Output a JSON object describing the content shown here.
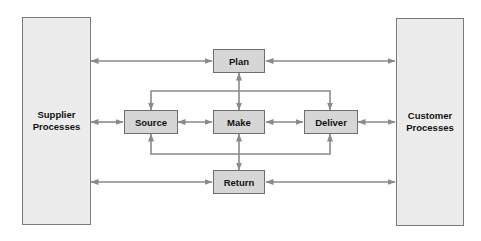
{
  "diagram": {
    "type": "process-flow",
    "external_entities": {
      "supplier": {
        "line1": "Supplier",
        "line2": "Processes"
      },
      "customer": {
        "line1": "Customer",
        "line2": "Processes"
      }
    },
    "processes": {
      "plan": "Plan",
      "source": "Source",
      "make": "Make",
      "deliver": "Deliver",
      "return": "Return"
    },
    "connections": [
      {
        "from": "Supplier Processes",
        "to": "Plan",
        "direction": "bidirectional"
      },
      {
        "from": "Plan",
        "to": "Customer Processes",
        "direction": "bidirectional"
      },
      {
        "from": "Plan",
        "to": "Make",
        "direction": "bidirectional"
      },
      {
        "from": "Plan",
        "to": "Source",
        "direction": "one-way"
      },
      {
        "from": "Plan",
        "to": "Deliver",
        "direction": "one-way"
      },
      {
        "from": "Supplier Processes",
        "to": "Source",
        "direction": "bidirectional"
      },
      {
        "from": "Source",
        "to": "Make",
        "direction": "bidirectional"
      },
      {
        "from": "Make",
        "to": "Deliver",
        "direction": "bidirectional"
      },
      {
        "from": "Deliver",
        "to": "Customer Processes",
        "direction": "bidirectional"
      },
      {
        "from": "Make",
        "to": "Return",
        "direction": "bidirectional"
      },
      {
        "from": "Return",
        "to": "Source",
        "direction": "one-way"
      },
      {
        "from": "Return",
        "to": "Deliver",
        "direction": "one-way"
      },
      {
        "from": "Supplier Processes",
        "to": "Return",
        "direction": "bidirectional"
      },
      {
        "from": "Return",
        "to": "Customer Processes",
        "direction": "bidirectional"
      }
    ],
    "colors": {
      "process_fill": "#d6d6d6",
      "entity_fill": "#ececec",
      "border": "#6e6e6e",
      "arrow": "#8a8a8a"
    }
  }
}
